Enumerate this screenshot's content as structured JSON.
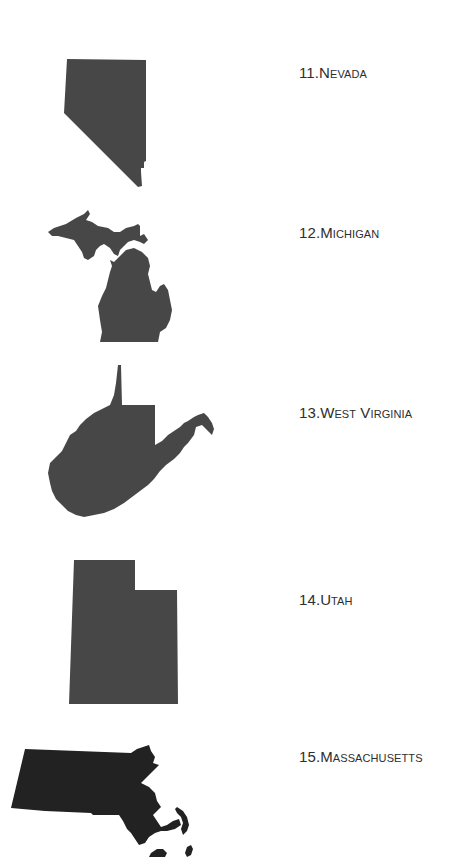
{
  "page": {
    "type": "state-identification-worksheet",
    "background_color": "#ffffff"
  },
  "states": [
    {
      "number": "11.",
      "name": "Nevada",
      "shape_icon": "nevada-silhouette",
      "fill": "#474747"
    },
    {
      "number": "12.",
      "name": "Michigan",
      "shape_icon": "michigan-silhouette",
      "fill": "#474747"
    },
    {
      "number": "13.",
      "name": "West Virginia",
      "shape_icon": "west-virginia-silhouette",
      "fill": "#474747"
    },
    {
      "number": "14.",
      "name": "Utah",
      "shape_icon": "utah-silhouette",
      "fill": "#474747"
    },
    {
      "number": "15.",
      "name": "Massachusetts",
      "shape_icon": "massachusetts-silhouette",
      "fill": "#222222"
    }
  ]
}
